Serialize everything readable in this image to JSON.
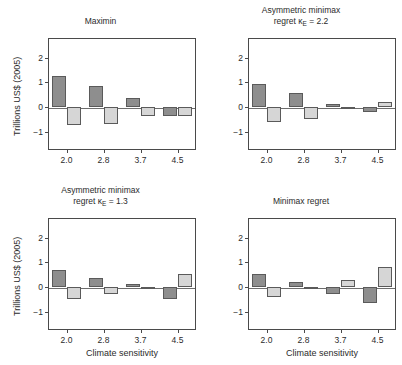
{
  "figure": {
    "ylabel": "Trillions US$ (2005)",
    "xlabel": "Climate sensitivity"
  },
  "chart_data": {
    "type": "bar",
    "title": "",
    "xlabel": "Climate sensitivity",
    "ylabel": "Trillions US$ (2005)",
    "categories": [
      "2.0",
      "2.8",
      "3.7",
      "4.5"
    ],
    "yticks": [
      -1,
      0,
      1,
      2
    ],
    "ytick_labels": [
      "−1",
      "0",
      "1",
      "2"
    ],
    "ylim": [
      -1.75,
      2.8
    ],
    "grid": false,
    "legend": "none",
    "colors": {
      "dark_bar": "#8e8e8e",
      "light_bar": "#d6d6d6",
      "bar_edge": "#5a5a5a",
      "axis": "#4a4a4a",
      "zero_line": "#6d6d6d",
      "background": "#ffffff",
      "text": "#2b2b2b"
    },
    "panels": [
      {
        "id": "maximin",
        "title": "Maximin",
        "title_lines": [
          "Maximin"
        ],
        "position": "top-left",
        "series": [
          {
            "name": "dark",
            "values": [
              1.25,
              0.85,
              0.38,
              -0.38
            ]
          },
          {
            "name": "light",
            "values": [
              -0.72,
              -0.68,
              -0.38,
              -0.38
            ]
          }
        ]
      },
      {
        "id": "asym-minimax-regret-2-2",
        "title": "Asymmetric minimax regret κ_E = 2.2",
        "title_lines": [
          "Asymmetric minimax",
          "regret κᴇ = 2.2"
        ],
        "position": "top-right",
        "series": [
          {
            "name": "dark",
            "values": [
              0.95,
              0.57,
              0.1,
              -0.2
            ]
          },
          {
            "name": "light",
            "values": [
              -0.62,
              -0.5,
              -0.05,
              0.22
            ]
          }
        ]
      },
      {
        "id": "asym-minimax-regret-1-3",
        "title": "Asymmetric minimax regret κ_E = 1.3",
        "title_lines": [
          "Asymmetric minimax",
          "regret κᴇ = 1.3"
        ],
        "position": "bottom-left",
        "series": [
          {
            "name": "dark",
            "values": [
              0.7,
              0.38,
              0.12,
              -0.48
            ]
          },
          {
            "name": "light",
            "values": [
              -0.5,
              -0.28,
              -0.06,
              0.52
            ]
          }
        ]
      },
      {
        "id": "minimax-regret",
        "title": "Minimax regret",
        "title_lines": [
          "Minimax regret"
        ],
        "position": "bottom-right",
        "series": [
          {
            "name": "dark",
            "values": [
              0.52,
              0.18,
              -0.28,
              -0.65
            ]
          },
          {
            "name": "light",
            "values": [
              -0.4,
              -0.1,
              0.3,
              0.8
            ]
          }
        ]
      }
    ]
  },
  "panel_titles": {
    "top_left_line1": "Maximin",
    "top_right_line1": "Asymmetric minimax",
    "top_right_line2_pre": "regret κ",
    "top_right_line2_sub": "E",
    "top_right_line2_post": " = 2.2",
    "bottom_left_line1": "Asymmetric minimax",
    "bottom_left_line2_pre": "regret κ",
    "bottom_left_line2_sub": "E",
    "bottom_left_line2_post": " = 1.3",
    "bottom_right_line1": "Minimax regret"
  }
}
